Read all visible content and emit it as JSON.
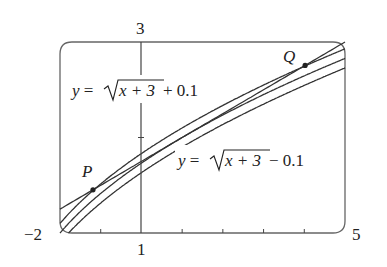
{
  "figure": {
    "viewing_rectangle": {
      "xmin": -2,
      "xmax": 5,
      "ymin": 1,
      "ymax": 3
    },
    "axis_labels": {
      "xmin": "−2",
      "xmax": "5",
      "ymin": "1",
      "ymax": "3"
    },
    "curves": [
      {
        "name": "upper-curve",
        "label": "+ 0.1",
        "expr": "sqrt(x+3)+0.1",
        "offset": 0.1
      },
      {
        "name": "base-curve",
        "expr": "sqrt(x+3)",
        "offset": 0
      },
      {
        "name": "lower-curve",
        "label": "− 0.1",
        "expr": "sqrt(x+3)-0.1",
        "offset": -0.1
      }
    ],
    "line": {
      "name": "linear-approximation",
      "slope": 0.25,
      "intercept": 1.75
    },
    "labels": {
      "upper_prefix": "y",
      "upper_eq": " = ",
      "upper_rad": "x + 3",
      "upper_suffix": " + 0.1",
      "lower_prefix": "y",
      "lower_eq": " = ",
      "lower_rad": "x + 3",
      "lower_suffix": " − 0.1"
    },
    "points": [
      {
        "name": "P",
        "label": "P",
        "x": -1.19
      },
      {
        "name": "Q",
        "label": "Q",
        "x": 4.02
      }
    ],
    "colors": {
      "stroke": "#333333",
      "frame": "#555555"
    }
  }
}
